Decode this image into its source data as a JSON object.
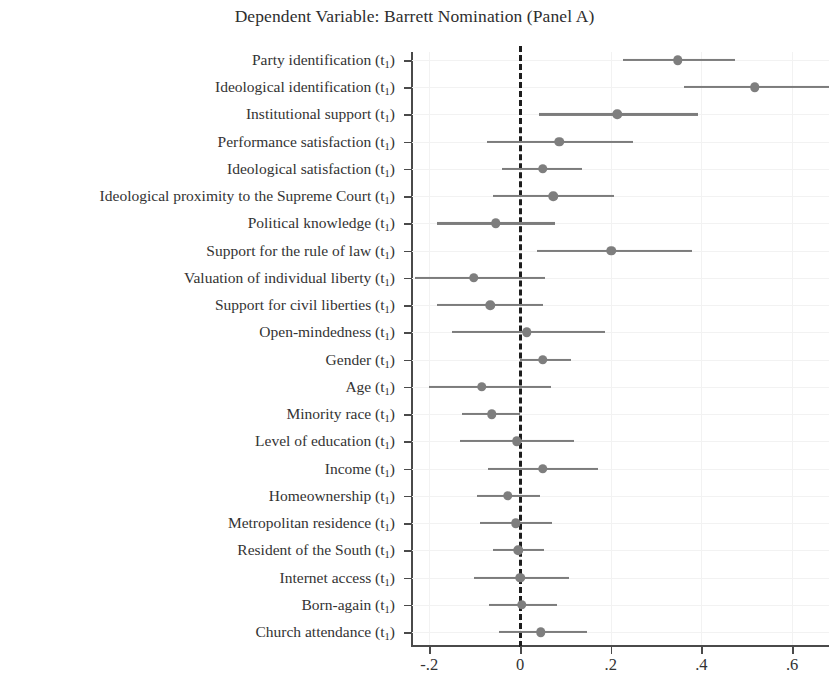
{
  "chart_data": {
    "type": "scatter",
    "title": "Dependent Variable: Barrett Nomination (Panel A)",
    "xlabel": "",
    "ylabel": "",
    "xlim": [
      -0.265,
      0.682
    ],
    "grid": true,
    "legend": null,
    "xticks": [
      -0.2,
      0,
      0.2,
      0.4,
      0.6
    ],
    "xticklabels": [
      "-.2",
      "0",
      ".2",
      ".4",
      ".6"
    ],
    "zero_reference_line": 0,
    "point_color": "#7e7e7e",
    "ci_color": "#7c7c7c",
    "categories": [
      "Party identification (t1)",
      "Ideological identification (t1)",
      "Institutional support (t1)",
      "Performance satisfaction (t1)",
      "Ideological satisfaction (t1)",
      "Ideological proximity to the Supreme Court (t1)",
      "Political knowledge (t1)",
      "Support for the rule of law (t1)",
      "Valuation of individual liberty (t1)",
      "Support for civil liberties (t1)",
      "Open-mindedness (t1)",
      "Gender (t1)",
      "Age (t1)",
      "Minority race (t1)",
      "Level of education (t1)",
      "Income (t1)",
      "Homeownership (t1)",
      "Metropolitan residence (t1)",
      "Resident of the South (t1)",
      "Internet access (t1)",
      "Born-again (t1)",
      "Church attendance (t1)"
    ],
    "rows": [
      {
        "label_main": "Party identification",
        "label_sub": "1",
        "estimate": 0.348,
        "ci_low": 0.228,
        "ci_high": 0.474
      },
      {
        "label_main": "Ideological identification",
        "label_sub": "1",
        "estimate": 0.518,
        "ci_low": 0.362,
        "ci_high": 0.685
      },
      {
        "label_main": "Institutional support",
        "label_sub": "1",
        "estimate": 0.214,
        "ci_low": 0.042,
        "ci_high": 0.392
      },
      {
        "label_main": "Performance satisfaction",
        "label_sub": "1",
        "estimate": 0.086,
        "ci_low": -0.072,
        "ci_high": 0.249
      },
      {
        "label_main": "Ideological satisfaction",
        "label_sub": "1",
        "estimate": 0.05,
        "ci_low": -0.04,
        "ci_high": 0.137
      },
      {
        "label_main": "Ideological proximity to the Supreme Court",
        "label_sub": "1",
        "estimate": 0.073,
        "ci_low": -0.06,
        "ci_high": 0.207
      },
      {
        "label_main": "Political knowledge",
        "label_sub": "1",
        "estimate": -0.053,
        "ci_low": -0.184,
        "ci_high": 0.077
      },
      {
        "label_main": "Support for the rule of law",
        "label_sub": "1",
        "estimate": 0.201,
        "ci_low": 0.038,
        "ci_high": 0.38
      },
      {
        "label_main": "Valuation of individual liberty",
        "label_sub": "1",
        "estimate": -0.102,
        "ci_low": -0.232,
        "ci_high": 0.055
      },
      {
        "label_main": "Support for civil liberties",
        "label_sub": "1",
        "estimate": -0.066,
        "ci_low": -0.184,
        "ci_high": 0.051
      },
      {
        "label_main": "Open-mindedness",
        "label_sub": "1",
        "estimate": 0.015,
        "ci_low": -0.15,
        "ci_high": 0.188
      },
      {
        "label_main": "Gender",
        "label_sub": "1",
        "estimate": 0.05,
        "ci_low": 0.0,
        "ci_high": 0.112
      },
      {
        "label_main": "Age",
        "label_sub": "1",
        "estimate": -0.084,
        "ci_low": -0.201,
        "ci_high": 0.068
      },
      {
        "label_main": "Minority race",
        "label_sub": "1",
        "estimate": -0.062,
        "ci_low": -0.128,
        "ci_high": 0.0
      },
      {
        "label_main": "Level of education",
        "label_sub": "1",
        "estimate": -0.007,
        "ci_low": -0.132,
        "ci_high": 0.118
      },
      {
        "label_main": "Income",
        "label_sub": "1",
        "estimate": 0.05,
        "ci_low": -0.071,
        "ci_high": 0.172
      },
      {
        "label_main": "Homeownership",
        "label_sub": "1",
        "estimate": -0.027,
        "ci_low": -0.095,
        "ci_high": 0.044
      },
      {
        "label_main": "Metropolitan residence",
        "label_sub": "1",
        "estimate": -0.009,
        "ci_low": -0.088,
        "ci_high": 0.071
      },
      {
        "label_main": "Resident of the South",
        "label_sub": "1",
        "estimate": -0.004,
        "ci_low": -0.06,
        "ci_high": 0.053
      },
      {
        "label_main": "Internet access",
        "label_sub": "1",
        "estimate": 0.0,
        "ci_low": -0.101,
        "ci_high": 0.108
      },
      {
        "label_main": "Born-again",
        "label_sub": "1",
        "estimate": 0.004,
        "ci_low": -0.068,
        "ci_high": 0.081
      },
      {
        "label_main": "Church attendance",
        "label_sub": "1",
        "estimate": 0.046,
        "ci_low": -0.046,
        "ci_high": 0.148
      }
    ]
  }
}
